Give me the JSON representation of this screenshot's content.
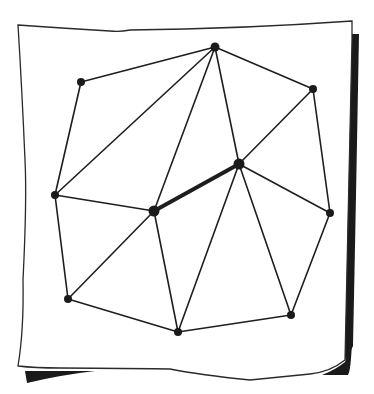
{
  "diagram": {
    "type": "triangulation-graph",
    "style": "hand-drawn on curled paper sheet",
    "colors": {
      "ink": "#1e1e1e",
      "paper": "#ffffff",
      "shadow": "#1a1a1a"
    },
    "nodes": [
      {
        "id": "A",
        "x": 81,
        "y": 82,
        "r": 4
      },
      {
        "id": "B",
        "x": 215,
        "y": 47,
        "r": 4.5
      },
      {
        "id": "C",
        "x": 313,
        "y": 89,
        "r": 4
      },
      {
        "id": "D",
        "x": 239,
        "y": 164,
        "r": 5.5
      },
      {
        "id": "E",
        "x": 154,
        "y": 211,
        "r": 5.5
      },
      {
        "id": "F",
        "x": 55,
        "y": 195,
        "r": 4
      },
      {
        "id": "G",
        "x": 330,
        "y": 213,
        "r": 4
      },
      {
        "id": "H",
        "x": 68,
        "y": 299,
        "r": 4
      },
      {
        "id": "I",
        "x": 178,
        "y": 332,
        "r": 4
      },
      {
        "id": "J",
        "x": 291,
        "y": 315,
        "r": 4
      }
    ],
    "edges": [
      {
        "from": "A",
        "to": "B",
        "thick": false
      },
      {
        "from": "A",
        "to": "F",
        "thick": false
      },
      {
        "from": "B",
        "to": "F",
        "thick": false
      },
      {
        "from": "B",
        "to": "E",
        "thick": false
      },
      {
        "from": "B",
        "to": "D",
        "thick": false
      },
      {
        "from": "B",
        "to": "C",
        "thick": false
      },
      {
        "from": "C",
        "to": "D",
        "thick": false
      },
      {
        "from": "C",
        "to": "G",
        "thick": false
      },
      {
        "from": "D",
        "to": "E",
        "thick": true
      },
      {
        "from": "D",
        "to": "G",
        "thick": false
      },
      {
        "from": "D",
        "to": "I",
        "thick": false
      },
      {
        "from": "D",
        "to": "J",
        "thick": false
      },
      {
        "from": "E",
        "to": "F",
        "thick": false
      },
      {
        "from": "E",
        "to": "H",
        "thick": false
      },
      {
        "from": "E",
        "to": "I",
        "thick": false
      },
      {
        "from": "F",
        "to": "H",
        "thick": false
      },
      {
        "from": "H",
        "to": "I",
        "thick": false
      },
      {
        "from": "I",
        "to": "J",
        "thick": false
      },
      {
        "from": "J",
        "to": "G",
        "thick": false
      }
    ]
  }
}
